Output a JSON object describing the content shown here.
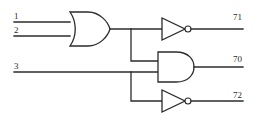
{
  "diagram": {
    "type": "logic-gate-schematic",
    "line_color": "#2b2b2b",
    "background_color": "#ffffff",
    "inputs": [
      {
        "id": "in1",
        "label": "1",
        "x": 14,
        "y": 16,
        "wire_y": 22
      },
      {
        "id": "in2",
        "label": "2",
        "x": 14,
        "y": 30,
        "wire_y": 36
      },
      {
        "id": "in3",
        "label": "3",
        "x": 14,
        "y": 66,
        "wire_y": 72
      }
    ],
    "outputs": [
      {
        "id": "out71",
        "label": "71",
        "x": 234,
        "y": 17,
        "wire_y": 27
      },
      {
        "id": "out70",
        "label": "70",
        "x": 234,
        "y": 59,
        "wire_y": 68
      },
      {
        "id": "out72",
        "label": "72",
        "x": 234,
        "y": 95,
        "wire_y": 105
      }
    ],
    "gates": [
      {
        "id": "or1",
        "type": "OR",
        "inputs": [
          "1",
          "2"
        ],
        "output_to": [
          "not1",
          "and1"
        ]
      },
      {
        "id": "not1",
        "type": "NOT",
        "inputs": [
          "or1"
        ],
        "output_to": [
          "71"
        ]
      },
      {
        "id": "and1",
        "type": "AND",
        "inputs": [
          "or1",
          "3"
        ],
        "output_to": [
          "70"
        ]
      },
      {
        "id": "not2",
        "type": "NOT",
        "inputs": [
          "3"
        ],
        "output_to": [
          "72"
        ]
      }
    ]
  }
}
